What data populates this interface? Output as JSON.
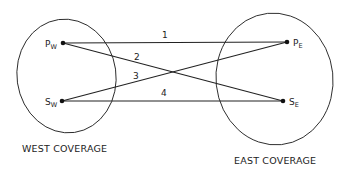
{
  "diagram": {
    "regions": [
      {
        "id": "west",
        "caption": "WEST COVERAGE"
      },
      {
        "id": "east",
        "caption": "EAST COVERAGE"
      }
    ],
    "nodes": [
      {
        "id": "pw",
        "main": "P",
        "sub": "W"
      },
      {
        "id": "sw",
        "main": "S",
        "sub": "W"
      },
      {
        "id": "pe",
        "main": "P",
        "sub": "E"
      },
      {
        "id": "se",
        "main": "S",
        "sub": "E"
      }
    ],
    "links": [
      {
        "label": "1",
        "from": "P_W",
        "to": "P_E"
      },
      {
        "label": "2",
        "from": "P_W",
        "to": "S_E"
      },
      {
        "label": "3",
        "from": "S_W",
        "to": "P_E"
      },
      {
        "label": "4",
        "from": "S_W",
        "to": "S_E"
      }
    ]
  }
}
